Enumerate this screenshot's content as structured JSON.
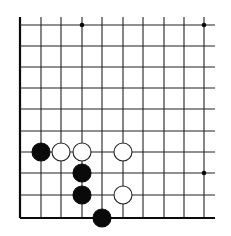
{
  "diagram": {
    "type": "go-board-fragment",
    "grid": {
      "columns": 10,
      "rows": 10,
      "x": [
        20,
        41,
        61,
        82,
        102,
        123,
        143,
        164,
        184,
        204
      ],
      "y": [
        25,
        46,
        67,
        88,
        109,
        131,
        152,
        173,
        195,
        218
      ],
      "top_extend": 17,
      "right_extend": 215,
      "line_color": "#222222",
      "edge_color": "#111111",
      "open_edges": [
        "top",
        "right"
      ],
      "closed_edges": [
        "left",
        "bottom"
      ]
    },
    "star_points": [
      {
        "col": 3,
        "row": 0
      },
      {
        "col": 9,
        "row": 0
      },
      {
        "col": 9,
        "row": 7
      }
    ],
    "stones": [
      {
        "color": "black",
        "col": 1,
        "row": 6
      },
      {
        "color": "white",
        "col": 2,
        "row": 6
      },
      {
        "color": "white",
        "col": 3,
        "row": 6
      },
      {
        "color": "white",
        "col": 5,
        "row": 6
      },
      {
        "color": "black",
        "col": 3,
        "row": 7
      },
      {
        "color": "black",
        "col": 3,
        "row": 8
      },
      {
        "color": "white",
        "col": 5,
        "row": 8
      },
      {
        "color": "black",
        "col": 4,
        "row": 9
      }
    ],
    "stone_radius": 9,
    "colors": {
      "black_stone": "#0a0a0a",
      "white_stone": "#ffffff",
      "white_stroke": "#222222",
      "background": "#ffffff"
    }
  }
}
